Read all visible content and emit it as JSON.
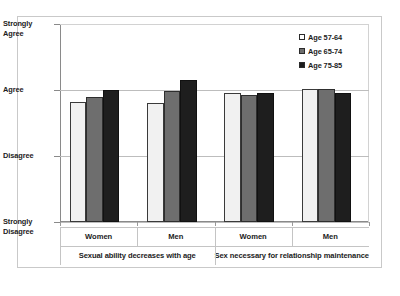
{
  "chart_data": {
    "type": "bar",
    "title": "",
    "xlabel": "",
    "ylabel": "",
    "grid": true,
    "legend_position": "top-right",
    "y_axis": {
      "type": "ordinal",
      "tick_labels": [
        "Strongly Agree",
        "Agree",
        "Disagree",
        "Strongly Disagree"
      ],
      "tick_values": [
        4,
        3,
        2,
        1
      ],
      "ylim": [
        1,
        4
      ]
    },
    "groups": [
      {
        "question": "Sexual ability decreases with age",
        "categories": [
          {
            "label": "Women",
            "values": [
              2.82,
              2.89,
              3.0
            ]
          },
          {
            "label": "Men",
            "values": [
              2.81,
              2.99,
              3.15
            ]
          }
        ]
      },
      {
        "question": "Sex necessary for relationship maintenance",
        "categories": [
          {
            "label": "Women",
            "values": [
              2.96,
              2.93,
              2.96
            ]
          },
          {
            "label": "Men",
            "values": [
              3.01,
              3.01,
              2.95
            ]
          }
        ]
      }
    ],
    "series": [
      {
        "name": "Age 57-64",
        "color": "#f1f1f1",
        "values": [
          2.82,
          2.81,
          2.96,
          3.01
        ]
      },
      {
        "name": "Age 65-74",
        "color": "#6e6e6e",
        "values": [
          2.89,
          2.99,
          2.93,
          3.01
        ]
      },
      {
        "name": "Age 75-85",
        "color": "#1e1e1e",
        "values": [
          3.0,
          3.15,
          2.96,
          2.95
        ]
      }
    ],
    "categories": [
      "Sexual ability decreases with age / Women",
      "Sexual ability decreases with age / Men",
      "Sex necessary for relationship maintenance / Women",
      "Sex necessary for relationship maintenance / Men"
    ]
  },
  "axis": {
    "y_labels": [
      {
        "line1": "Strongly",
        "line2": "Agree"
      },
      {
        "line1": "Agree",
        "line2": ""
      },
      {
        "line1": "Disagree",
        "line2": ""
      },
      {
        "line1": "Strongly",
        "line2": "Disagree"
      }
    ],
    "x_labels": [
      "Women",
      "Men",
      "Women",
      "Men"
    ],
    "group_labels": [
      "Sexual ability decreases with age",
      "Sex necessary for relationship maintenance"
    ]
  },
  "legend": {
    "items": [
      {
        "label": "Age 57-64",
        "color": "#ffffff"
      },
      {
        "label": "Age 65-74",
        "color": "#6e6e6e"
      },
      {
        "label": "Age 75-85",
        "color": "#1b1b1b"
      }
    ]
  },
  "colors": {
    "series_1": "#f1f1f1",
    "series_2": "#6e6e6e",
    "series_3": "#1e1e1e",
    "axis": "#8a8a8a",
    "grid": "#bdbdbd",
    "frame": "#c9c9c9",
    "background": "#ffffff"
  }
}
